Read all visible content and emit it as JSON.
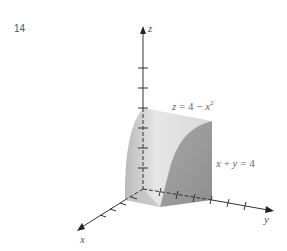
{
  "figure": {
    "number": "14",
    "axes": {
      "x_label": "x",
      "y_label": "y",
      "z_label": "z"
    },
    "surfaces": {
      "top": {
        "lhs": "z",
        "eq": "=",
        "rhs_a": "4",
        "minus": "−",
        "rhs_var": "x",
        "exp": "2"
      },
      "side": {
        "a": "x",
        "plus": "+",
        "b": "y",
        "eq": "=",
        "c": "4"
      }
    },
    "colors": {
      "axis": "#333333",
      "solid_light": "#e8e8e8",
      "solid_mid": "#c4c4c4",
      "solid_dark": "#9a9a9a"
    }
  }
}
